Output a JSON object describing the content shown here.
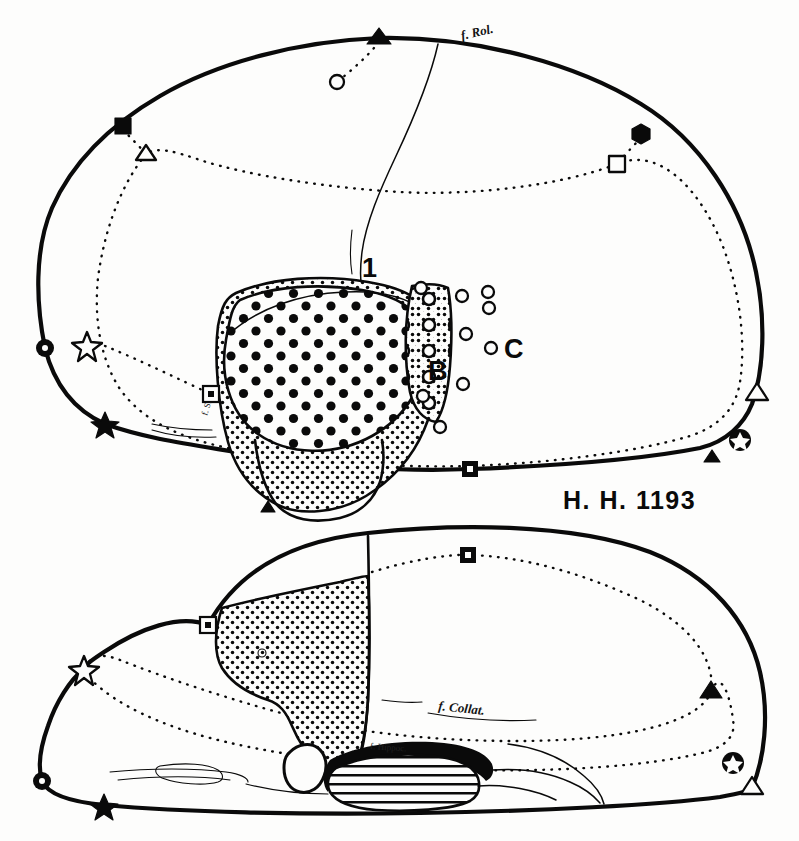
{
  "figure": {
    "title": "H. H. 1193",
    "specimen_id": "H. H. 1193",
    "background_color": "#fdfdfc",
    "ink_color": "#0a0a0a",
    "type": "anatomical-brain-diagram",
    "views": [
      {
        "name": "lateral-view",
        "position": "upper"
      },
      {
        "name": "medial-view",
        "position": "lower"
      }
    ]
  },
  "upper_view": {
    "name": "lateral-brain-view",
    "labels": {
      "fissure_rolando": "f. Rol.",
      "region_one": "1",
      "region_b": "B",
      "region_c": "C",
      "fissure_small": "f. S."
    },
    "regions": [
      {
        "id": "A",
        "texture": "large-filled-dots",
        "description": "core dense large dot zone"
      },
      {
        "id": "A-outer",
        "texture": "fine-stipple",
        "description": "fine stipple surround"
      },
      {
        "id": "B",
        "texture": "open-circles-on-stipple",
        "description": "transition band"
      },
      {
        "id": "C",
        "texture": "scattered-open-circles",
        "description": "sparse scattered circles"
      }
    ],
    "specimen_label": "H. H. 1193"
  },
  "lower_view": {
    "name": "medial-brain-view",
    "labels": {
      "fissure_collateral": "f. Collat.",
      "fissure_hippocampal": "f. Hippoc.",
      "region_mark": "6"
    },
    "regions": [
      {
        "id": "stipple-region",
        "texture": "fine-stipple",
        "description": "large medial stippled area"
      },
      {
        "id": "hippocampus",
        "texture": "horizontal-hatch",
        "description": "horizontally lined ventricle/hippocampal body"
      }
    ]
  },
  "markers": {
    "upper_solid_outline": [
      {
        "name": "filled-triangle",
        "shape": "triangle-filled",
        "x": 379,
        "y": 38
      },
      {
        "name": "filled-square",
        "shape": "square-filled",
        "x": 123,
        "y": 126
      },
      {
        "name": "filled-hexagon",
        "shape": "hexagon-filled",
        "x": 641,
        "y": 134
      },
      {
        "name": "filled-circle-dot",
        "shape": "circle-filled-dot",
        "x": 45,
        "y": 348
      },
      {
        "name": "filled-star",
        "shape": "star-filled",
        "x": 105,
        "y": 424
      },
      {
        "name": "open-triangle-right",
        "shape": "triangle-open",
        "x": 757,
        "y": 394
      },
      {
        "name": "star-in-circle",
        "shape": "star-in-circle",
        "x": 740,
        "y": 440
      },
      {
        "name": "small-triangle",
        "shape": "triangle-filled-small",
        "x": 712,
        "y": 457
      },
      {
        "name": "square-dot-lower",
        "shape": "square-filled-dot",
        "x": 470,
        "y": 469
      },
      {
        "name": "small-triangle-mid",
        "shape": "triangle-filled-small",
        "x": 268,
        "y": 508
      }
    ],
    "upper_dotted_line": [
      {
        "name": "open-circle-top",
        "shape": "circle-open",
        "x": 337,
        "y": 82
      },
      {
        "name": "open-triangle-left",
        "shape": "triangle-open",
        "x": 146,
        "y": 154
      },
      {
        "name": "open-square-right",
        "shape": "square-open",
        "x": 617,
        "y": 164
      },
      {
        "name": "open-star-left",
        "shape": "star-open",
        "x": 87,
        "y": 345
      },
      {
        "name": "square-dot-left",
        "shape": "square-open-dot",
        "x": 211,
        "y": 394
      }
    ],
    "lower_solid_outline": [
      {
        "name": "open-star-lower",
        "shape": "star-open",
        "x": 84,
        "y": 669
      },
      {
        "name": "square-open-dot-lower",
        "shape": "square-open-dot",
        "x": 208,
        "y": 625
      },
      {
        "name": "circle-dot-lower-left",
        "shape": "circle-filled-dot",
        "x": 42,
        "y": 781
      },
      {
        "name": "filled-star-lower",
        "shape": "star-filled",
        "x": 104,
        "y": 805
      },
      {
        "name": "open-triangle-lower-right",
        "shape": "triangle-open",
        "x": 752,
        "y": 788
      }
    ],
    "lower_dotted_line": [
      {
        "name": "square-filled-dot-top",
        "shape": "square-filled-dot",
        "x": 468,
        "y": 555
      },
      {
        "name": "filled-triangle-right",
        "shape": "triangle-filled",
        "x": 711,
        "y": 692
      },
      {
        "name": "star-in-circle-lower",
        "shape": "star-in-circle",
        "x": 733,
        "y": 763
      }
    ]
  }
}
